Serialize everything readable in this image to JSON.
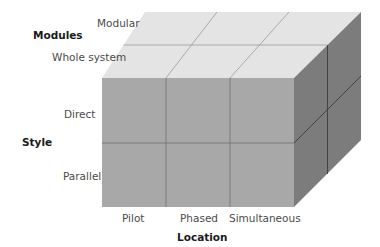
{
  "diagram": {
    "type": "3d-cube-matrix",
    "axes": {
      "modules": {
        "title": "Modules",
        "values": [
          "Modular",
          "Whole system"
        ]
      },
      "style": {
        "title": "Style",
        "values": [
          "Direct",
          "Parallel"
        ]
      },
      "location": {
        "title": "Location",
        "values": [
          "Pilot",
          "Phased",
          "Simultaneous"
        ]
      }
    },
    "colors": {
      "top_face": "#e4e4e4",
      "front_face": "#a8a8a8",
      "side_face": "#7c7c7c",
      "grid_line": "#707070"
    }
  }
}
